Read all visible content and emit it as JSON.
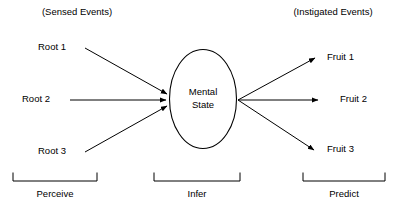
{
  "figure": {
    "type": "flow-diagram",
    "background_color": "#ffffff",
    "stroke_color": "#000000"
  },
  "annotations": {
    "left_header": "(Sensed Events)",
    "right_header": "(Instigated Events)"
  },
  "inputs": [
    {
      "label": "Root 1"
    },
    {
      "label": "Root 2"
    },
    {
      "label": "Root 3"
    }
  ],
  "center_node": {
    "line1": "Mental",
    "line2": "State",
    "shape": "ellipse"
  },
  "outputs": [
    {
      "label": "Fruit 1"
    },
    {
      "label": "Fruit 2"
    },
    {
      "label": "Fruit 3"
    }
  ],
  "phases": [
    {
      "label": "Perceive"
    },
    {
      "label": "Infer"
    },
    {
      "label": "Predict"
    }
  ]
}
